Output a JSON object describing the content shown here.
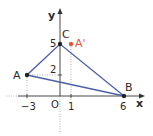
{
  "diagram": {
    "type": "coordinate-triangle",
    "axes": {
      "x_label": "x",
      "y_label": "y",
      "origin_label": "O"
    },
    "x_ticks": [
      "−3",
      "1",
      "6"
    ],
    "y_ticks": [
      "2",
      "5"
    ],
    "points": [
      {
        "name": "A",
        "x": -3,
        "y": 2,
        "color": "#222222"
      },
      {
        "name": "B",
        "x": 6,
        "y": 0,
        "color": "#222222"
      },
      {
        "name": "C",
        "x": 0,
        "y": 5,
        "color": "#222222"
      },
      {
        "name": "A'",
        "x": 1,
        "y": 5,
        "color": "#e8533a"
      }
    ],
    "triangle": [
      "A",
      "B",
      "C"
    ],
    "colors": {
      "triangle_edge": "#4a5fa8",
      "guide": "#9a9a9a",
      "axis": "#333333",
      "accent": "#e8533a"
    }
  }
}
